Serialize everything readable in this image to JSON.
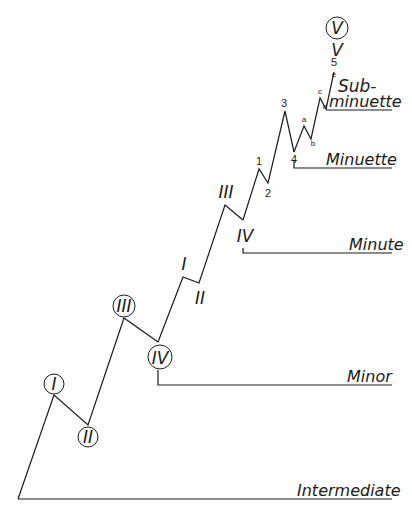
{
  "diagram": {
    "type": "elliott-wave-degree-diagram",
    "degrees": {
      "intermediate": "Intermediate",
      "minor": "Minor",
      "minute": "Minute",
      "minuette": "Minuette",
      "subminuette_1": "Sub-",
      "subminuette_2": "minuette"
    },
    "waves": {
      "intermediate_top": "V",
      "minor": [
        "I",
        "II",
        "III",
        "IV",
        "V"
      ],
      "minute": [
        "I",
        "II",
        "III",
        "IV"
      ],
      "minuette": [
        "1",
        "2",
        "3",
        "4",
        "5"
      ],
      "subminuette": [
        "a",
        "b",
        "c",
        "d",
        "e"
      ]
    }
  }
}
